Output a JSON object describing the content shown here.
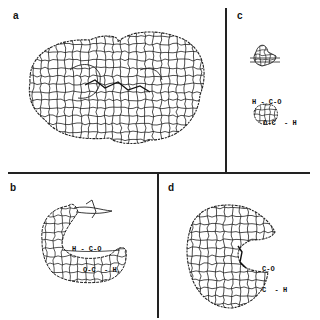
{
  "figure": {
    "panels": [
      {
        "id": "a",
        "label": "a",
        "content": "molecular surface mesh (two-lobed, full)"
      },
      {
        "id": "b",
        "label": "b",
        "content": "partial surface mesh with molecule",
        "formula": {
          "top": "H - C-O",
          "bottom": "O-C  - H"
        }
      },
      {
        "id": "c",
        "label": "c",
        "content": "small surface fragments with molecule",
        "formula": {
          "top": "H - C-O",
          "bottom": "O-C  - H"
        }
      },
      {
        "id": "d",
        "label": "d",
        "content": "half surface mesh with molecule",
        "formula": {
          "top": "C-O",
          "bottom": "C  - H"
        }
      }
    ],
    "line_color": "#222222",
    "background": "#ffffff"
  }
}
